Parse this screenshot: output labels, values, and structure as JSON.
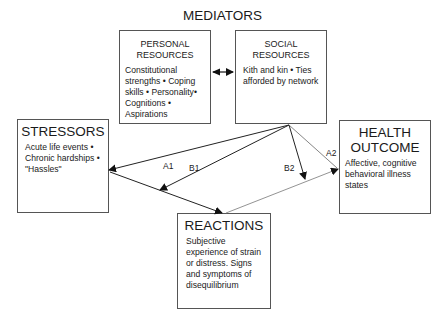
{
  "title": "MEDIATORS",
  "boxes": {
    "personal": {
      "heading_line1": "PERSONAL",
      "heading_line2": "RESOURCES",
      "body": "Constitutional strengths • Coping skills • Personality• Cognitions • Aspirations"
    },
    "social": {
      "heading_line1": "SOCIAL",
      "heading_line2": "RESOURCES",
      "body": "Kith and kin • Ties afforded by network"
    },
    "stressors": {
      "heading": "STRESSORS",
      "body": "Acute life events • Chronic hardships • \"Hassles\""
    },
    "health": {
      "heading_line1": "HEALTH",
      "heading_line2": "OUTCOME",
      "body": "Affective, cognitive behavioral illness states"
    },
    "reactions": {
      "heading": "REACTIONS",
      "body": "Subjective experience of strain or distress. Signs and symptoms of disequilibrium"
    }
  },
  "path_labels": {
    "a1": "A1",
    "b1": "B1",
    "b2": "B2",
    "a2": "A2"
  }
}
